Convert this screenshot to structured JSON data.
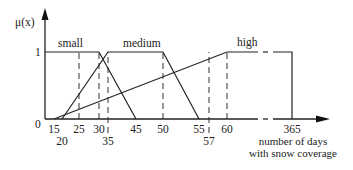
{
  "chart_data": {
    "type": "line",
    "title": "",
    "ylabel": "μ(x)",
    "xlabel_lines": [
      "number of days",
      "with snow coverage"
    ],
    "y_ticks": [
      {
        "value": 1,
        "label": "1"
      }
    ],
    "origin_label": "0",
    "x_ticks": [
      {
        "value": 15,
        "label": "15",
        "row": 0
      },
      {
        "value": 20,
        "label": "20",
        "row": 1
      },
      {
        "value": 25,
        "label": "25",
        "row": 0
      },
      {
        "value": 30,
        "label": "30",
        "row": 0
      },
      {
        "value": 35,
        "label": "35",
        "row": 1
      },
      {
        "value": 45,
        "label": "45",
        "row": 0
      },
      {
        "value": 50,
        "label": "50",
        "row": 0
      },
      {
        "value": 55,
        "label": "55",
        "row": 0
      },
      {
        "value": 57,
        "label": "57",
        "row": 1
      },
      {
        "value": 60,
        "label": "60",
        "row": 0
      },
      {
        "value": 365,
        "label": "365",
        "row": 0
      }
    ],
    "series": [
      {
        "name": "small",
        "label": "small",
        "points": [
          [
            0,
            1
          ],
          [
            30,
            1
          ],
          [
            45,
            0
          ]
        ]
      },
      {
        "name": "medium",
        "label": "medium",
        "points": [
          [
            20,
            0
          ],
          [
            35,
            1
          ],
          [
            50,
            1
          ],
          [
            55,
            0
          ]
        ]
      },
      {
        "name": "high",
        "label": "high",
        "points": [
          [
            15,
            0
          ],
          [
            60,
            1
          ],
          [
            365,
            1
          ],
          [
            365,
            0
          ]
        ]
      }
    ],
    "dashed_guides": [
      25,
      30,
      35,
      50,
      57,
      60
    ],
    "ylim": [
      0,
      1
    ],
    "xlim": [
      0,
      365
    ],
    "axis_break": "between 60 and 365",
    "grid": false,
    "legend": "none"
  }
}
